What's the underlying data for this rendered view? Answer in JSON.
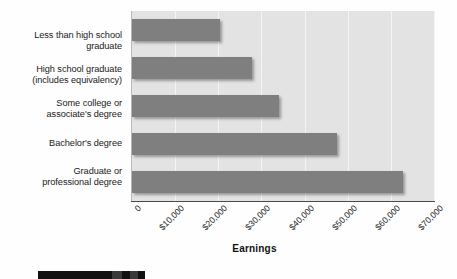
{
  "chart_data": {
    "type": "bar",
    "orientation": "horizontal",
    "title": "",
    "xlabel": "Earnings",
    "ylabel": "",
    "categories": [
      "Less than high school graduate",
      "High school graduate (includes equivalency)",
      "Some college or associate's degree",
      "Bachelor's degree",
      "Graduate or professional degree"
    ],
    "category_lines": [
      [
        "Less than high school",
        "graduate"
      ],
      [
        "High school graduate",
        "(includes equivalency)"
      ],
      [
        "Some college or",
        "associate's degree"
      ],
      [
        "Bachelor's degree"
      ],
      [
        "Graduate or",
        "professional degree"
      ]
    ],
    "values": [
      20300,
      27900,
      34100,
      47500,
      62900
    ],
    "xlim": [
      0,
      70000
    ],
    "xticks": [
      0,
      10000,
      20000,
      30000,
      40000,
      50000,
      60000,
      70000
    ],
    "xtick_labels": [
      "0",
      "$10,000",
      "$20,000",
      "$30,000",
      "$40,000",
      "$50,000",
      "$60,000",
      "$70,000"
    ],
    "grid": true,
    "grid_axis": "x",
    "legend": "none",
    "colors": {
      "bar": "#7f7f7f",
      "plot_background": "#e3e3e3",
      "gridline": "#f4f4f4",
      "axis": "#4a4a4a",
      "text": "#1a1a1a",
      "page_background": "#fefefe"
    }
  }
}
